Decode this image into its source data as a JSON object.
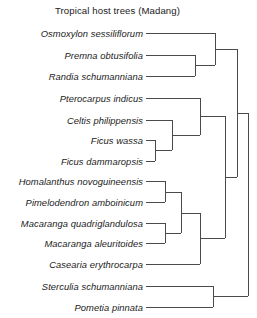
{
  "figure": {
    "title": "Tropical host trees (Madang)",
    "label_right_edge": 143,
    "line_color": "#4a4a4a",
    "background": "#ffffff"
  },
  "taxa": [
    {
      "name": "Osmoxylon sessiliflorum",
      "y": 33
    },
    {
      "name": "Premna obtusifolia",
      "y": 55
    },
    {
      "name": "Randia schumanniana",
      "y": 76
    },
    {
      "name": "Pterocarpus indicus",
      "y": 98
    },
    {
      "name": "Celtis philippensis",
      "y": 120
    },
    {
      "name": "Ficus wassa",
      "y": 140
    },
    {
      "name": "Ficus dammaropsis",
      "y": 161
    },
    {
      "name": "Homalanthus novoguineensis",
      "y": 181
    },
    {
      "name": "Pimelodendron amboinicum",
      "y": 202
    },
    {
      "name": "Macaranga quadriglandulosa",
      "y": 223
    },
    {
      "name": "Macaranga aleuritoides",
      "y": 243
    },
    {
      "name": "Casearia erythrocarpa",
      "y": 264
    },
    {
      "name": "Sterculia schumanniana",
      "y": 286
    },
    {
      "name": "Pometia pinnata",
      "y": 307
    }
  ],
  "chart_data": {
    "type": "dendrogram",
    "title": "Tropical host trees (Madang)",
    "orientation": "left-to-right",
    "leaf_count": 14,
    "leaves": [
      "Osmoxylon sessiliflorum",
      "Premna obtusifolia",
      "Randia schumanniana",
      "Pterocarpus indicus",
      "Celtis philippensis",
      "Ficus wassa",
      "Ficus dammaropsis",
      "Homalanthus novoguineensis",
      "Pimelodendron amboinicum",
      "Macaranga quadriglandulosa",
      "Macaranga aleuritoides",
      "Casearia erythrocarpa",
      "Sterculia schumanniana",
      "Pometia pinnata"
    ],
    "newick": "(((Osmoxylon sessiliflorum,(Premna obtusifolia,Randia schumanniana)),((Pterocarpus indicus,(Celtis philippensis,(Ficus wassa,Ficus dammaropsis))),(((Homalanthus novoguineensis,Pimelodendron amboinicum),(Macaranga quadriglandulosa,Macaranga aleuritoides)),Casearia erythrocarpa))),(Sterculia schumanniana,Pometia pinnata));",
    "segments": [
      {
        "id": "leaf-osmoxylon",
        "type": "horizontal",
        "x1": 146,
        "x2": 215,
        "y": 33
      },
      {
        "id": "leaf-premna",
        "type": "horizontal",
        "x1": 146,
        "x2": 195,
        "y": 55
      },
      {
        "id": "leaf-randia",
        "type": "horizontal",
        "x1": 146,
        "x2": 195,
        "y": 76
      },
      {
        "id": "node-premna-randia-v",
        "type": "vertical",
        "x": 195,
        "y1": 55,
        "y2": 76
      },
      {
        "id": "node-premna-randia-h",
        "type": "horizontal",
        "x1": 195,
        "x2": 215,
        "y": 65
      },
      {
        "id": "node-clade1-v",
        "type": "vertical",
        "x": 215,
        "y1": 33,
        "y2": 65
      },
      {
        "id": "node-clade1-h",
        "type": "horizontal",
        "x1": 215,
        "x2": 237,
        "y": 49
      },
      {
        "id": "leaf-pterocarpus",
        "type": "horizontal",
        "x1": 146,
        "x2": 200,
        "y": 98
      },
      {
        "id": "leaf-celtis",
        "type": "horizontal",
        "x1": 146,
        "x2": 172,
        "y": 120
      },
      {
        "id": "leaf-ficus-wassa",
        "type": "horizontal",
        "x1": 146,
        "x2": 155,
        "y": 140
      },
      {
        "id": "leaf-ficus-dammaropsis",
        "type": "horizontal",
        "x1": 146,
        "x2": 155,
        "y": 161
      },
      {
        "id": "node-ficus-v",
        "type": "vertical",
        "x": 155,
        "y1": 140,
        "y2": 161
      },
      {
        "id": "node-ficus-h",
        "type": "horizontal",
        "x1": 155,
        "x2": 172,
        "y": 150
      },
      {
        "id": "node-celtis-ficus-v",
        "type": "vertical",
        "x": 172,
        "y1": 120,
        "y2": 150
      },
      {
        "id": "node-celtis-ficus-h",
        "type": "horizontal",
        "x1": 172,
        "x2": 200,
        "y": 135
      },
      {
        "id": "node-rosid-v",
        "type": "vertical",
        "x": 200,
        "y1": 98,
        "y2": 135
      },
      {
        "id": "node-rosid-h",
        "type": "horizontal",
        "x1": 200,
        "x2": 225,
        "y": 116
      },
      {
        "id": "leaf-homalanthus",
        "type": "horizontal",
        "x1": 146,
        "x2": 165,
        "y": 181
      },
      {
        "id": "leaf-pimelodendron",
        "type": "horizontal",
        "x1": 146,
        "x2": 165,
        "y": 202
      },
      {
        "id": "node-homalanthus-pimelo-v",
        "type": "vertical",
        "x": 165,
        "y1": 181,
        "y2": 202
      },
      {
        "id": "node-homalanthus-pimelo-h",
        "type": "horizontal",
        "x1": 165,
        "x2": 181,
        "y": 192
      },
      {
        "id": "leaf-macaranga-quad",
        "type": "horizontal",
        "x1": 146,
        "x2": 165,
        "y": 223
      },
      {
        "id": "leaf-macaranga-aleu",
        "type": "horizontal",
        "x1": 146,
        "x2": 165,
        "y": 243
      },
      {
        "id": "node-macaranga-v",
        "type": "vertical",
        "x": 165,
        "y1": 223,
        "y2": 243
      },
      {
        "id": "node-macaranga-h",
        "type": "horizontal",
        "x1": 165,
        "x2": 181,
        "y": 233
      },
      {
        "id": "node-euphorb-v",
        "type": "vertical",
        "x": 181,
        "y1": 192,
        "y2": 233
      },
      {
        "id": "node-euphorb-h",
        "type": "horizontal",
        "x1": 181,
        "x2": 200,
        "y": 213
      },
      {
        "id": "leaf-casearia",
        "type": "horizontal",
        "x1": 146,
        "x2": 200,
        "y": 264
      },
      {
        "id": "node-malpighial-v",
        "type": "vertical",
        "x": 200,
        "y1": 213,
        "y2": 264
      },
      {
        "id": "node-malpighial-h",
        "type": "horizontal",
        "x1": 200,
        "x2": 225,
        "y": 238
      },
      {
        "id": "node-bigclade-v",
        "type": "vertical",
        "x": 225,
        "y1": 116,
        "y2": 238
      },
      {
        "id": "node-bigclade-h",
        "type": "horizontal",
        "x1": 225,
        "x2": 237,
        "y": 177
      },
      {
        "id": "node-upper-v",
        "type": "vertical",
        "x": 237,
        "y1": 49,
        "y2": 177
      },
      {
        "id": "node-upper-h",
        "type": "horizontal",
        "x1": 237,
        "x2": 248,
        "y": 113
      },
      {
        "id": "leaf-sterculia",
        "type": "horizontal",
        "x1": 146,
        "x2": 213,
        "y": 286
      },
      {
        "id": "leaf-pometia",
        "type": "horizontal",
        "x1": 146,
        "x2": 213,
        "y": 307
      },
      {
        "id": "node-sterculia-pometia-v",
        "type": "vertical",
        "x": 213,
        "y1": 286,
        "y2": 307
      },
      {
        "id": "node-sterculia-pometia-h",
        "type": "horizontal",
        "x1": 213,
        "x2": 248,
        "y": 296
      },
      {
        "id": "node-root-v",
        "type": "vertical",
        "x": 248,
        "y1": 113,
        "y2": 296
      }
    ]
  }
}
